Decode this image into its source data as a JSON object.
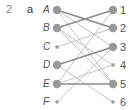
{
  "question": {
    "number": "2",
    "part": "a"
  },
  "chart_data": {
    "type": "bipartite-graph",
    "left_nodes": [
      {
        "label": "A",
        "size": "large"
      },
      {
        "label": "B",
        "size": "large"
      },
      {
        "label": "C",
        "size": "small"
      },
      {
        "label": "D",
        "size": "large"
      },
      {
        "label": "E",
        "size": "large"
      },
      {
        "label": "F",
        "size": "small"
      }
    ],
    "right_nodes": [
      {
        "label": "1",
        "size": "large"
      },
      {
        "label": "2",
        "size": "large"
      },
      {
        "label": "3",
        "size": "large"
      },
      {
        "label": "4",
        "size": "small"
      },
      {
        "label": "5",
        "size": "large"
      },
      {
        "label": "6",
        "size": "small"
      }
    ],
    "edges": [
      {
        "from": "A",
        "to": "2",
        "style": "dark"
      },
      {
        "from": "A",
        "to": "3",
        "style": "light"
      },
      {
        "from": "A",
        "to": "5",
        "style": "light"
      },
      {
        "from": "B",
        "to": "1",
        "style": "dark"
      },
      {
        "from": "B",
        "to": "4",
        "style": "light"
      },
      {
        "from": "B",
        "to": "5",
        "style": "light"
      },
      {
        "from": "C",
        "to": "2",
        "style": "light"
      },
      {
        "from": "D",
        "to": "3",
        "style": "dark"
      },
      {
        "from": "D",
        "to": "6",
        "style": "light"
      },
      {
        "from": "E",
        "to": "5",
        "style": "dark"
      },
      {
        "from": "E",
        "to": "1",
        "style": "light"
      },
      {
        "from": "E",
        "to": "4",
        "style": "light"
      },
      {
        "from": "F",
        "to": "3",
        "style": "light"
      }
    ],
    "colors": {
      "dark": "#8c8c8c",
      "light": "#c4c4c4",
      "node": "#999999"
    }
  }
}
